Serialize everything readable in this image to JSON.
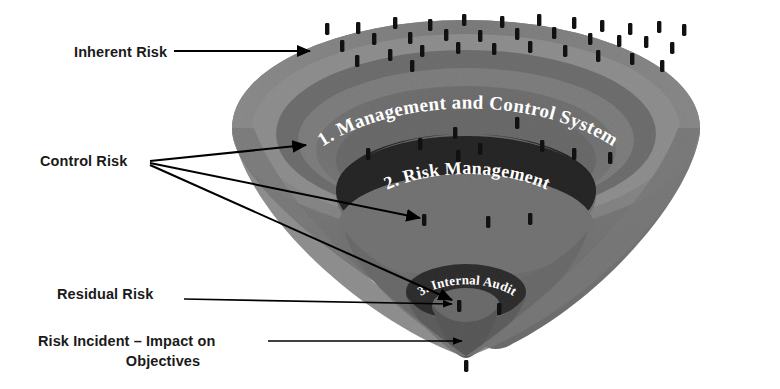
{
  "diagram": {
    "type": "funnel-cone-diagram",
    "background_color": "#ffffff",
    "callouts": [
      {
        "id": "inherent-risk",
        "label": "Inherent Risk",
        "arrows": 1
      },
      {
        "id": "control-risk",
        "label": "Control Risk",
        "arrows": 3
      },
      {
        "id": "residual-risk",
        "label": "Residual Risk",
        "arrows": 1
      },
      {
        "id": "risk-incident",
        "label_line1": "Risk Incident – Impact on",
        "label_line2": "Objectives",
        "arrows": 1
      }
    ],
    "bands": [
      {
        "index": 1,
        "label": "1. Management and Control System",
        "fill": "#6e6e6e",
        "text_color": "#ffffff"
      },
      {
        "index": 2,
        "label": "2. Risk Management",
        "fill": "#2b2b2b",
        "text_color": "#ffffff"
      },
      {
        "index": 3,
        "label": "3. Internal Audit",
        "fill": "#2e2e2e",
        "text_color": "#ffffff"
      }
    ],
    "colors": {
      "cone_outer": "#828282",
      "cone_rim_light": "#9a9a9a",
      "cone_mid": "#717171",
      "cone_inner": "#626262",
      "band_dark": "#262626",
      "tick_mark": "#111111",
      "arrow": "#000000",
      "label_text": "#1a1a1a"
    },
    "tick_marks": {
      "name": "risk-event-tick",
      "description": "small vertical black bars representing individual risk events",
      "count_outer_rim": 34,
      "count_band1": 9,
      "count_band2": 3,
      "count_band3": 2,
      "count_below_tip": 1
    }
  }
}
